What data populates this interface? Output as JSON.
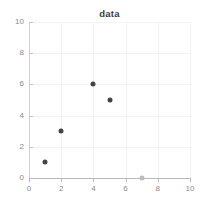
{
  "chart_data": {
    "type": "scatter",
    "title": "data",
    "xlabel": "",
    "ylabel": "",
    "xlim": [
      0,
      10
    ],
    "ylim": [
      0,
      10
    ],
    "xticks": [
      0,
      2,
      4,
      6,
      8,
      10
    ],
    "yticks": [
      0,
      2,
      4,
      6,
      8,
      10
    ],
    "xticklabels": [
      "0",
      "2",
      "4",
      "6",
      "8",
      "10"
    ],
    "yticklabels": [
      "0",
      "2",
      "4",
      "6",
      "8",
      "10"
    ],
    "grid": true,
    "legend": false,
    "marker": "circle",
    "marker_size": 5,
    "points": [
      {
        "x": 1,
        "y": 1,
        "color": "#444444"
      },
      {
        "x": 2,
        "y": 3,
        "color": "#444444"
      },
      {
        "x": 4,
        "y": 6,
        "color": "#444444"
      },
      {
        "x": 5,
        "y": 5,
        "color": "#444444"
      },
      {
        "x": 7,
        "y": 0,
        "color": "#bdbdbd"
      }
    ],
    "series": [
      {
        "name": "data",
        "x": [
          1,
          2,
          4,
          5,
          7
        ],
        "y": [
          1,
          3,
          6,
          5,
          0
        ]
      }
    ]
  },
  "colors": {
    "background": "#ffffff",
    "axis": "#b9b9b9",
    "grid": "#f2f2f2",
    "ticklabel": "#8a8a8a",
    "title": "#3a3a3a",
    "marker_dark": "#444444",
    "marker_light": "#bdbdbd"
  }
}
